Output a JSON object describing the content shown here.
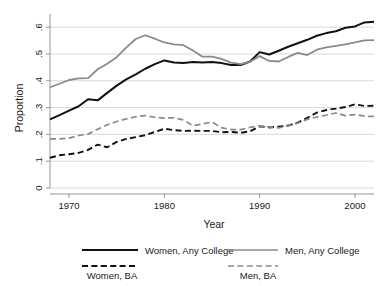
{
  "chart_data": {
    "type": "line",
    "title": "",
    "xlabel": "Year",
    "ylabel": "Proportion",
    "xlim": [
      1968,
      2002
    ],
    "ylim": [
      0,
      0.65
    ],
    "grid": "horizontal",
    "legend_position": "bottom",
    "xticks": [
      1970,
      1980,
      1990,
      2000
    ],
    "xtick_labels": [
      "1970",
      "1980",
      "1990",
      "2000"
    ],
    "yticks": [
      0,
      0.1,
      0.2,
      0.3,
      0.4,
      0.5,
      0.6
    ],
    "ytick_labels": [
      "0",
      ".1",
      ".2",
      ".3",
      ".4",
      ".5",
      ".6"
    ],
    "x": [
      1968,
      1969,
      1970,
      1971,
      1972,
      1973,
      1974,
      1975,
      1976,
      1977,
      1978,
      1979,
      1980,
      1981,
      1982,
      1983,
      1984,
      1985,
      1986,
      1987,
      1988,
      1989,
      1990,
      1991,
      1992,
      1993,
      1994,
      1995,
      1996,
      1997,
      1998,
      1999,
      2000,
      2001,
      2002
    ],
    "series": [
      {
        "name": "Women, Any College",
        "color": "#111111",
        "style": "solid",
        "width": 2.0,
        "values": [
          0.256,
          0.272,
          0.289,
          0.305,
          0.331,
          0.327,
          0.355,
          0.382,
          0.405,
          0.424,
          0.445,
          0.462,
          0.476,
          0.468,
          0.466,
          0.47,
          0.468,
          0.47,
          0.466,
          0.459,
          0.459,
          0.472,
          0.507,
          0.498,
          0.512,
          0.527,
          0.54,
          0.553,
          0.568,
          0.578,
          0.585,
          0.598,
          0.603,
          0.618,
          0.62
        ]
      },
      {
        "name": "Men, Any College",
        "color": "#8a8a8a",
        "style": "solid",
        "width": 1.8,
        "values": [
          0.376,
          0.389,
          0.403,
          0.409,
          0.41,
          0.443,
          0.464,
          0.488,
          0.524,
          0.556,
          0.57,
          0.557,
          0.543,
          0.536,
          0.533,
          0.513,
          0.49,
          0.49,
          0.482,
          0.468,
          0.462,
          0.471,
          0.492,
          0.474,
          0.472,
          0.489,
          0.504,
          0.496,
          0.516,
          0.525,
          0.53,
          0.536,
          0.543,
          0.551,
          0.552
        ]
      },
      {
        "name": "Women, BA",
        "color": "#111111",
        "style": "dashed",
        "width": 1.9,
        "values": [
          0.113,
          0.122,
          0.126,
          0.131,
          0.142,
          0.162,
          0.152,
          0.172,
          0.183,
          0.19,
          0.197,
          0.209,
          0.221,
          0.216,
          0.213,
          0.214,
          0.213,
          0.213,
          0.208,
          0.209,
          0.206,
          0.212,
          0.23,
          0.226,
          0.229,
          0.233,
          0.244,
          0.262,
          0.281,
          0.291,
          0.296,
          0.302,
          0.312,
          0.306,
          0.307
        ]
      },
      {
        "name": "Men, BA",
        "color": "#8a8a8a",
        "style": "dashed",
        "width": 1.7,
        "values": [
          0.183,
          0.183,
          0.186,
          0.196,
          0.201,
          0.219,
          0.236,
          0.248,
          0.258,
          0.266,
          0.27,
          0.264,
          0.261,
          0.262,
          0.254,
          0.233,
          0.239,
          0.246,
          0.225,
          0.218,
          0.218,
          0.226,
          0.232,
          0.228,
          0.224,
          0.233,
          0.242,
          0.256,
          0.265,
          0.272,
          0.28,
          0.27,
          0.274,
          0.268,
          0.267
        ]
      }
    ]
  },
  "legend": {
    "entries": [
      {
        "label": "Women, Any College",
        "color": "#111111",
        "style": "solid"
      },
      {
        "label": "Men, Any College",
        "color": "#8a8a8a",
        "style": "solid"
      },
      {
        "label": "Women, BA",
        "color": "#111111",
        "style": "dashed"
      },
      {
        "label": "Men, BA",
        "color": "#8a8a8a",
        "style": "dashed"
      }
    ]
  }
}
